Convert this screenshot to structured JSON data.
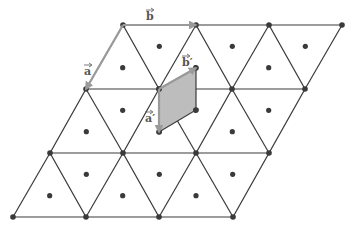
{
  "figure": {
    "lattice": {
      "rows": [
        {
          "y": 25,
          "vertices_x": [
            123,
            196,
            269,
            342
          ]
        },
        {
          "y": 89,
          "vertices_x": [
            86,
            159,
            232,
            305
          ]
        },
        {
          "y": 153,
          "vertices_x": [
            50,
            123,
            196,
            269
          ]
        },
        {
          "y": 217,
          "vertices_x": [
            13,
            86,
            159,
            233
          ]
        }
      ],
      "edge_color": "#3a3a3a",
      "dot_color": "#3a3a3a"
    },
    "shaded_cell": {
      "points": [
        [
          159,
          89
        ],
        [
          196,
          68
        ],
        [
          196,
          110
        ],
        [
          159,
          132
        ]
      ],
      "fill": "#bdbdbd"
    },
    "vectors": [
      {
        "name": "a",
        "label": "a",
        "from": [
          123,
          25
        ],
        "to": [
          86,
          89
        ],
        "label_pos": [
          84,
          75
        ]
      },
      {
        "name": "b",
        "label": "b",
        "from": [
          123,
          25
        ],
        "to": [
          196,
          25
        ],
        "label_pos": [
          146,
          20
        ]
      },
      {
        "name": "a-prime",
        "label": "a′",
        "from": [
          159,
          89
        ],
        "to": [
          159,
          132
        ],
        "label_pos": [
          145,
          122
        ]
      },
      {
        "name": "b-prime",
        "label": "b′",
        "from": [
          159,
          89
        ],
        "to": [
          196,
          68
        ],
        "label_pos": [
          182,
          66
        ]
      }
    ],
    "vector_color": "#9a9a9a"
  }
}
